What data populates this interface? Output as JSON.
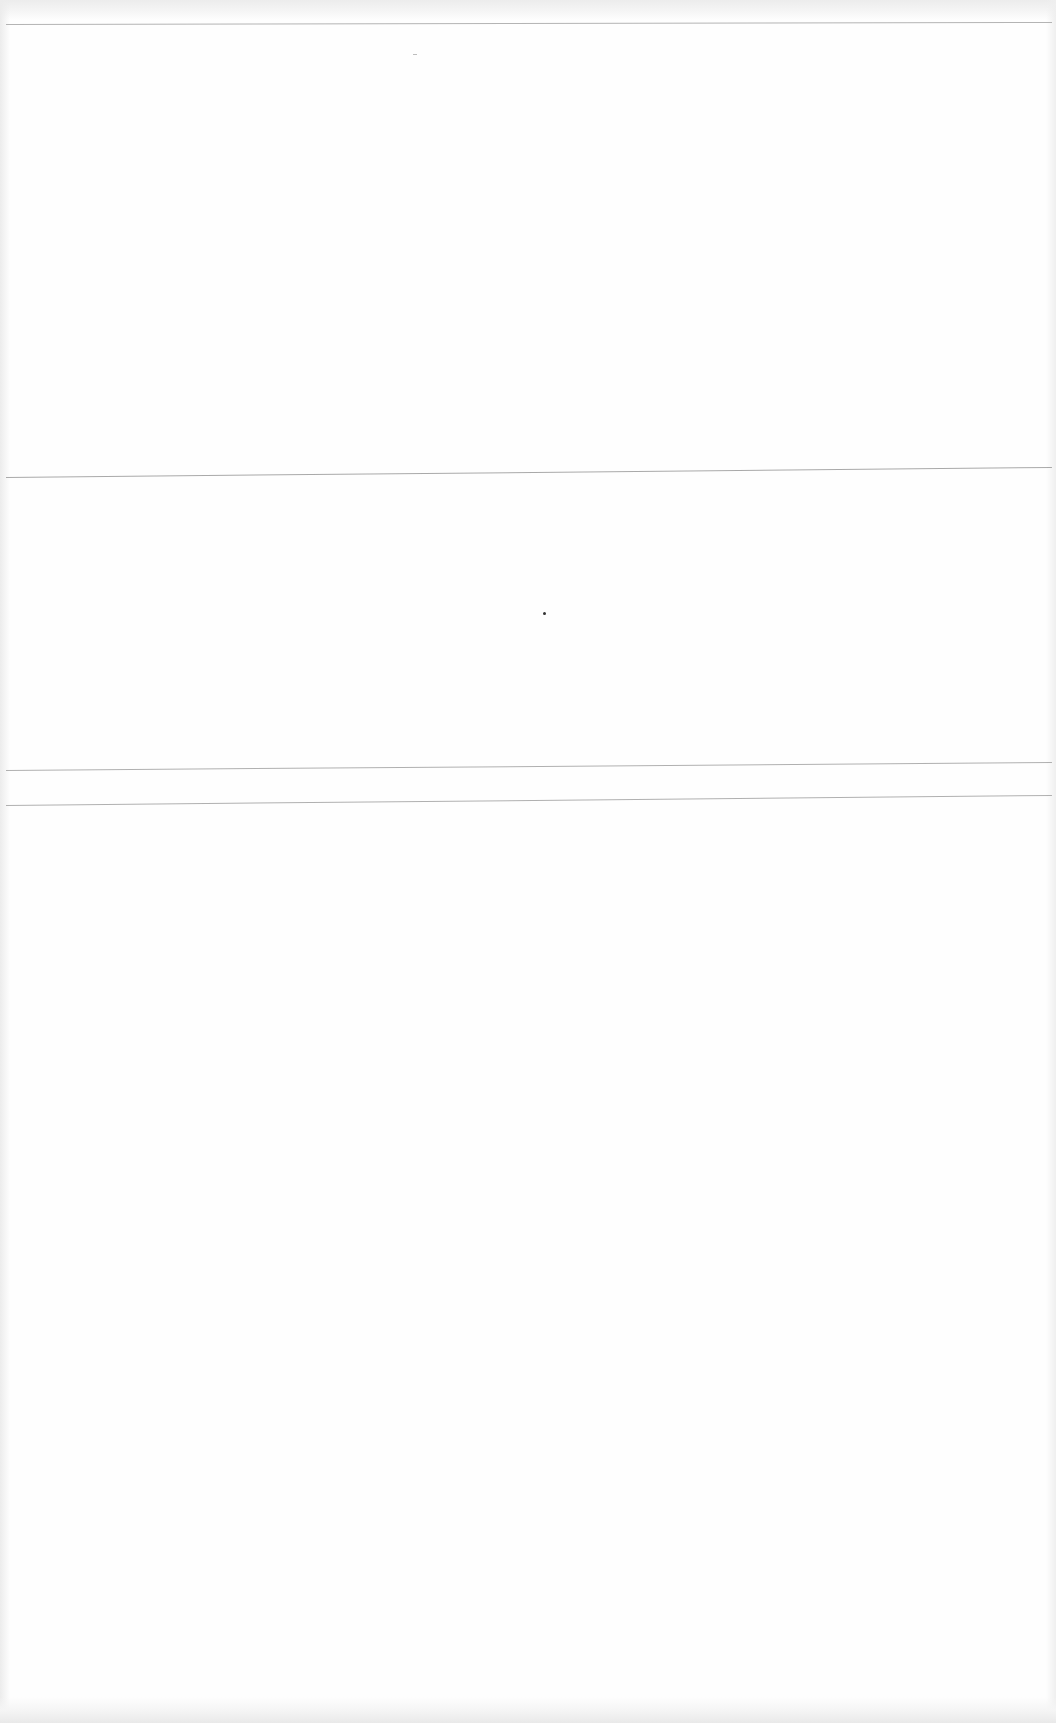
{
  "document": {
    "type": "blank scanned page",
    "text_content": "",
    "rules": [
      {
        "name": "rule-1",
        "y_left": 24,
        "y_right": 22
      },
      {
        "name": "rule-2",
        "y_left": 477,
        "y_right": 467
      },
      {
        "name": "rule-3",
        "y_left": 770,
        "y_right": 762
      },
      {
        "name": "rule-4",
        "y_left": 805,
        "y_right": 795
      }
    ],
    "marks": [
      {
        "name": "dot",
        "x": 544,
        "y": 613
      }
    ],
    "colors": {
      "paper": "#fefefe",
      "rule": "#a9a9a9",
      "mark": "#333333"
    }
  }
}
